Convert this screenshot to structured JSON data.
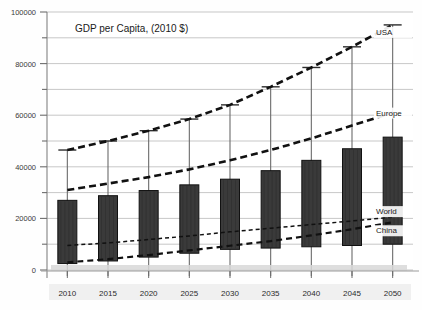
{
  "chart_data": {
    "type": "bar",
    "title": "GDP per Capita, (2010 $)",
    "xlabel": "",
    "ylabel": "",
    "ylim": [
      0,
      100000
    ],
    "xlim_categories": [
      "2010",
      "2015",
      "2020",
      "2025",
      "2030",
      "2035",
      "2040",
      "2045",
      "2050"
    ],
    "categories": [
      "2010",
      "2015",
      "2020",
      "2025",
      "2030",
      "2035",
      "2040",
      "2045",
      "2050"
    ],
    "ytick_labels": [
      "0",
      "20000",
      "40000",
      "60000",
      "80000",
      "100000"
    ],
    "ytick_values": [
      0,
      20000,
      40000,
      60000,
      80000,
      100000
    ],
    "yminor_values": [
      10000,
      30000,
      50000,
      70000,
      90000
    ],
    "grid": true,
    "legend_position": "inline-right",
    "bar_series": {
      "name": "range-bar",
      "color": "#333333",
      "bottoms": [
        2500,
        3500,
        5000,
        6500,
        8000,
        8500,
        9000,
        9500,
        10000
      ],
      "tops": [
        27000,
        28800,
        30800,
        33000,
        35200,
        38500,
        42500,
        47000,
        51500
      ]
    },
    "whisker_series": {
      "name": "USA-whisker",
      "color": "#6b6b6b",
      "values": [
        46500,
        50000,
        54000,
        58500,
        64000,
        71000,
        78500,
        86500,
        95000
      ]
    },
    "series": [
      {
        "name": "USA",
        "label": "USA",
        "color": "#111111",
        "style": "dashed-thick",
        "values": [
          46500,
          50000,
          54000,
          58500,
          64000,
          71000,
          78500,
          86500,
          95000
        ]
      },
      {
        "name": "Europe",
        "label": "Europe",
        "color": "#111111",
        "style": "dashed-thick",
        "values": [
          31000,
          33500,
          36000,
          39000,
          42500,
          46500,
          51000,
          56000,
          61000
        ]
      },
      {
        "name": "World",
        "label": "World",
        "color": "#111111",
        "style": "dashed-thin",
        "values": [
          9500,
          10500,
          11800,
          13200,
          14800,
          16200,
          17600,
          19000,
          20500
        ]
      },
      {
        "name": "China",
        "label": "China",
        "color": "#111111",
        "style": "dashed-medium",
        "values": [
          3000,
          4200,
          5800,
          7600,
          9400,
          11200,
          13400,
          15800,
          18500
        ]
      }
    ]
  }
}
